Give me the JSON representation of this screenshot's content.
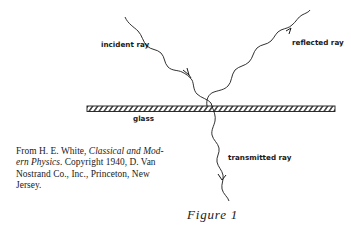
{
  "figure": {
    "caption": "Figure 1",
    "labels": {
      "incident": "incident ray",
      "reflected": "reflected ray",
      "transmitted": "transmitted ray",
      "medium": "glass"
    },
    "citation": {
      "prefix": "From H. E. White, ",
      "title": "Classical and Mod-ern Physics",
      "title_line1": "Classical and Mod-",
      "title_line2": "ern Physics",
      "suffix_line2": ". Copyright 1940, D. Van",
      "line3": "Nostrand Co., Inc., Princeton, New",
      "line4": "Jersey."
    }
  },
  "colors": {
    "ink": "#1a1a1a",
    "background": "#ffffff"
  }
}
